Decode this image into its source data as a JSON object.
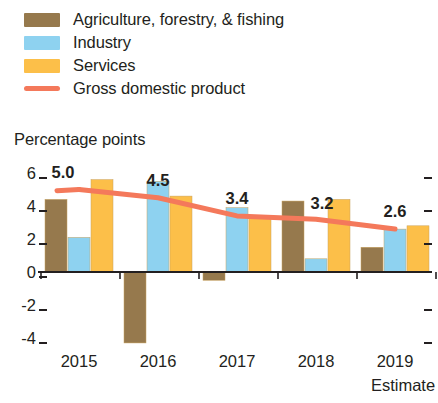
{
  "legend": {
    "items": [
      {
        "label": "Agriculture, forestry, & fishing",
        "color": "#96794d",
        "marker": "swatch",
        "name": "legend-agriculture"
      },
      {
        "label": "Industry",
        "color": "#8ed2f0",
        "marker": "swatch",
        "name": "legend-industry"
      },
      {
        "label": "Services",
        "color": "#fcbf49",
        "marker": "swatch",
        "name": "legend-services"
      },
      {
        "label": "Gross domestic product",
        "color": "#f4795b",
        "marker": "line",
        "name": "legend-gdp"
      }
    ]
  },
  "axis_title": "Percentage points",
  "chart_data": {
    "type": "bar",
    "title": "",
    "subtitle": "",
    "xlabel": "",
    "ylabel": "Percentage points",
    "ylim": [
      -5.2,
      6.6
    ],
    "yticks": [
      6,
      4,
      2,
      0,
      -2,
      -4
    ],
    "ytick_labels": [
      "6",
      "4",
      "2",
      "0",
      "-2",
      "-4"
    ],
    "grid": false,
    "legend_position": "top-left",
    "categories": [
      "2015",
      "2016",
      "2017",
      "2018",
      "2019"
    ],
    "category_notes": [
      "",
      "",
      "",
      "",
      "Estimate"
    ],
    "series": [
      {
        "name": "Agriculture, forestry, & fishing",
        "color": "#96794d",
        "values": [
          4.4,
          -4.3,
          -0.5,
          4.3,
          1.5
        ]
      },
      {
        "name": "Industry",
        "color": "#8ed2f0",
        "values": [
          2.1,
          5.5,
          3.9,
          0.8,
          2.6
        ]
      },
      {
        "name": "Services",
        "color": "#fcbf49",
        "values": [
          5.6,
          4.6,
          3.3,
          4.4,
          2.8
        ]
      }
    ],
    "line_series": {
      "name": "Gross domestic product",
      "color": "#f4795b",
      "values": [
        5.0,
        4.5,
        3.4,
        3.2,
        2.6
      ],
      "point_labels": [
        "5.0",
        "4.5",
        "3.4",
        "3.2",
        "2.6"
      ]
    }
  }
}
